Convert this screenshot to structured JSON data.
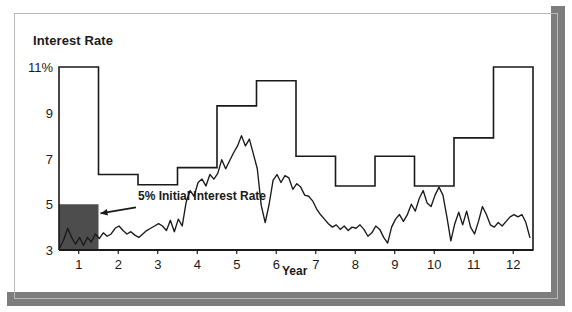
{
  "figure": {
    "title": "Interest Rate",
    "x_axis_title": "Year",
    "annotation": "5% Initial Interest Rate",
    "colors": {
      "frame": "#7d7d7d",
      "line": "#1a1a1a",
      "shaded_block": "#4d4d4d",
      "background": "#ffffff"
    }
  },
  "ticks": {
    "y": [
      "11%",
      "9",
      "7",
      "5",
      "3"
    ],
    "x": [
      "1",
      "2",
      "3",
      "4",
      "5",
      "6",
      "7",
      "8",
      "9",
      "10",
      "11",
      "12"
    ]
  },
  "chart_data": {
    "type": "line",
    "title": "Interest Rate",
    "xlabel": "Year",
    "ylabel": "Interest Rate",
    "xlim": [
      0.5,
      12.5
    ],
    "ylim": [
      3,
      11
    ],
    "yticks": [
      3,
      5,
      7,
      9,
      11
    ],
    "ytick_labels": [
      "3",
      "5",
      "7",
      "9",
      "11%"
    ],
    "xticks": [
      1,
      2,
      3,
      4,
      5,
      6,
      7,
      8,
      9,
      10,
      11,
      12
    ],
    "grid": false,
    "legend": "none",
    "annotations": [
      {
        "text": "5% Initial Interest Rate",
        "points_to": {
          "x": 1.5,
          "y": 4.6
        },
        "text_at": {
          "x": 2.55,
          "y": 4.95
        }
      }
    ],
    "shaded_region": {
      "label": "5% Initial Interest Rate",
      "x_from": 0.5,
      "x_to": 1.5,
      "y_from": 3,
      "y_to": 5,
      "color": "#4d4d4d"
    },
    "series": [
      {
        "name": "Interest Rate Cap",
        "type": "step",
        "style": "post",
        "steps": [
          {
            "x_from": 0.5,
            "x_to": 1.5,
            "value": 11.0
          },
          {
            "x_from": 1.5,
            "x_to": 2.5,
            "value": 6.3
          },
          {
            "x_from": 2.5,
            "x_to": 3.5,
            "value": 5.85
          },
          {
            "x_from": 3.5,
            "x_to": 4.5,
            "value": 6.6
          },
          {
            "x_from": 4.5,
            "x_to": 5.5,
            "value": 9.3
          },
          {
            "x_from": 5.5,
            "x_to": 6.5,
            "value": 10.4
          },
          {
            "x_from": 6.5,
            "x_to": 7.5,
            "value": 7.1
          },
          {
            "x_from": 7.5,
            "x_to": 8.5,
            "value": 5.8
          },
          {
            "x_from": 8.5,
            "x_to": 9.5,
            "value": 7.1
          },
          {
            "x_from": 9.5,
            "x_to": 10.5,
            "value": 5.8
          },
          {
            "x_from": 10.5,
            "x_to": 11.5,
            "value": 7.9
          },
          {
            "x_from": 11.5,
            "x_to": 12.5,
            "value": 11.0
          }
        ]
      },
      {
        "name": "Actual Interest Rate",
        "type": "line",
        "x": [
          0.52,
          0.62,
          0.72,
          0.82,
          0.92,
          1.02,
          1.12,
          1.22,
          1.32,
          1.42,
          1.52,
          1.62,
          1.72,
          1.82,
          1.92,
          2.02,
          2.12,
          2.22,
          2.32,
          2.42,
          2.52,
          2.62,
          2.72,
          2.82,
          2.92,
          3.02,
          3.12,
          3.22,
          3.32,
          3.42,
          3.52,
          3.62,
          3.72,
          3.82,
          3.92,
          4.02,
          4.12,
          4.22,
          4.32,
          4.42,
          4.52,
          4.62,
          4.72,
          4.82,
          4.92,
          5.02,
          5.12,
          5.22,
          5.32,
          5.42,
          5.52,
          5.62,
          5.72,
          5.82,
          5.92,
          6.02,
          6.12,
          6.22,
          6.32,
          6.42,
          6.52,
          6.62,
          6.72,
          6.82,
          6.92,
          7.02,
          7.12,
          7.22,
          7.32,
          7.42,
          7.52,
          7.62,
          7.72,
          7.82,
          7.92,
          8.02,
          8.12,
          8.22,
          8.32,
          8.42,
          8.52,
          8.62,
          8.72,
          8.82,
          8.92,
          9.02,
          9.12,
          9.22,
          9.32,
          9.42,
          9.52,
          9.62,
          9.72,
          9.82,
          9.92,
          10.02,
          10.12,
          10.22,
          10.32,
          10.42,
          10.52,
          10.62,
          10.72,
          10.82,
          10.92,
          11.02,
          11.12,
          11.22,
          11.32,
          11.42,
          11.52,
          11.62,
          11.72,
          11.82,
          11.92,
          12.02,
          12.12,
          12.22,
          12.32,
          12.42
        ],
        "y": [
          3.1,
          3.45,
          3.95,
          3.55,
          3.25,
          3.55,
          3.2,
          3.55,
          3.35,
          3.7,
          3.5,
          3.75,
          3.6,
          3.7,
          3.95,
          4.05,
          3.85,
          3.7,
          3.8,
          3.65,
          3.55,
          3.7,
          3.85,
          3.95,
          4.05,
          4.15,
          4.05,
          3.85,
          4.3,
          3.8,
          4.35,
          4.05,
          5.1,
          5.6,
          5.35,
          5.95,
          6.1,
          5.8,
          6.3,
          6.1,
          6.35,
          6.95,
          6.55,
          6.9,
          7.25,
          7.55,
          8.0,
          7.55,
          7.85,
          7.2,
          6.55,
          4.95,
          4.2,
          5.0,
          6.05,
          6.3,
          5.95,
          6.25,
          6.15,
          5.65,
          5.9,
          5.75,
          5.4,
          5.35,
          5.15,
          4.8,
          4.55,
          4.35,
          4.15,
          4.0,
          4.1,
          3.9,
          4.05,
          3.85,
          4.0,
          3.95,
          4.1,
          3.9,
          3.6,
          3.75,
          4.05,
          3.9,
          3.55,
          3.3,
          4.0,
          4.35,
          4.55,
          4.25,
          4.55,
          5.0,
          4.7,
          5.25,
          5.6,
          5.05,
          4.9,
          5.4,
          5.75,
          5.4,
          4.45,
          3.4,
          4.15,
          4.65,
          4.1,
          4.7,
          4.0,
          3.7,
          4.25,
          4.9,
          4.55,
          4.1,
          4.0,
          4.2,
          4.05,
          4.25,
          4.45,
          4.55,
          4.45,
          4.55,
          4.2,
          3.55
        ]
      }
    ]
  }
}
